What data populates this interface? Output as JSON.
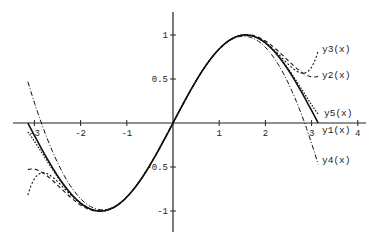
{
  "chart_data": {
    "type": "line",
    "title": "",
    "xlabel": "",
    "ylabel": "",
    "xlim": [
      -3.4,
      4.2
    ],
    "ylim": [
      -1.25,
      1.25
    ],
    "grid": false,
    "legend_position": "inline labels at right end of curves",
    "x_ticks": [
      "-3",
      "-2",
      "-1",
      "1",
      "2",
      "3",
      "4"
    ],
    "y_ticks": [
      "1",
      "0.5",
      "-0.5",
      "-1"
    ],
    "x": [
      -3.1416,
      -2.8,
      -2.4,
      -2.0,
      -1.5708,
      -1.2,
      -0.8,
      -0.4,
      0,
      0.4,
      0.8,
      1.2,
      1.5708,
      2.0,
      2.4,
      2.8,
      3.1416
    ],
    "series": [
      {
        "name": "y1(x)",
        "style": "solid",
        "values": [
          0.05,
          -0.33,
          -0.67,
          -0.91,
          -1.0,
          -0.93,
          -0.72,
          -0.39,
          0,
          0.39,
          0.72,
          0.93,
          1.0,
          0.91,
          0.67,
          0.33,
          -0.05
        ]
      },
      {
        "name": "y2(x)",
        "style": "dashed",
        "values": [
          -0.53,
          -0.59,
          -0.76,
          -0.96,
          -1.01,
          -0.93,
          -0.72,
          -0.39,
          0,
          0.39,
          0.72,
          0.93,
          1.01,
          0.96,
          0.76,
          0.59,
          0.53
        ]
      },
      {
        "name": "y3(x)",
        "style": "dashed-short",
        "values": [
          -0.82,
          -0.61,
          -0.72,
          -0.93,
          -1.0,
          -0.93,
          -0.72,
          -0.39,
          0,
          0.39,
          0.72,
          0.93,
          1.0,
          0.93,
          0.72,
          0.61,
          0.82
        ]
      },
      {
        "name": "y4(x)",
        "style": "dash-dot",
        "values": [
          0.47,
          0.0,
          -0.5,
          -0.86,
          -0.99,
          -0.93,
          -0.72,
          -0.39,
          0,
          0.39,
          0.72,
          0.93,
          0.99,
          0.86,
          0.5,
          0.0,
          -0.47
        ]
      },
      {
        "name": "y5(x)",
        "style": "dotted",
        "values": [
          -0.1,
          -0.37,
          -0.68,
          -0.91,
          -1.0,
          -0.93,
          -0.72,
          -0.39,
          0,
          0.39,
          0.72,
          0.93,
          1.0,
          0.91,
          0.68,
          0.37,
          0.1
        ]
      }
    ],
    "annotations": [
      "y3(x)",
      "y2(x)",
      "y5(x)",
      "y1(x)",
      "y4(x)"
    ]
  },
  "axes": {
    "x_ticks": [
      {
        "label": "-3",
        "v": -3
      },
      {
        "label": "-2",
        "v": -2
      },
      {
        "label": "-1",
        "v": -1
      },
      {
        "label": "1",
        "v": 1
      },
      {
        "label": "2",
        "v": 2
      },
      {
        "label": "3",
        "v": 3
      },
      {
        "label": "4",
        "v": 4
      }
    ],
    "y_ticks": [
      {
        "label": "1",
        "v": 1
      },
      {
        "label": "0.5",
        "v": 0.5
      },
      {
        "label": "-0.5",
        "v": -0.5
      },
      {
        "label": "-1",
        "v": -1
      }
    ]
  },
  "labels": {
    "y3": "y3(x)",
    "y2": "y2(x)",
    "y5": "y5(x)",
    "y1": "y1(x)",
    "y4": "y4(x)"
  }
}
